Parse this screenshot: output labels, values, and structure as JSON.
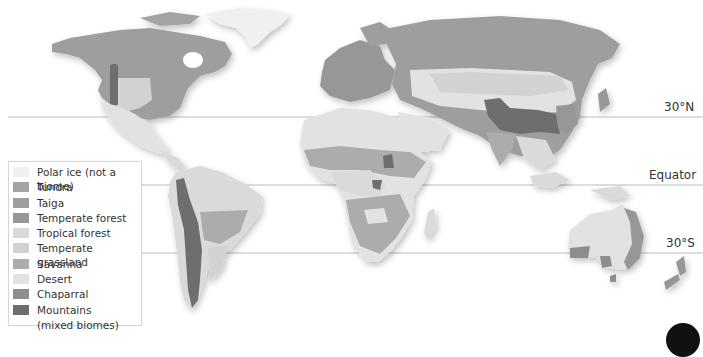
{
  "map": {
    "title": "World biomes",
    "latitude_lines": [
      {
        "label": "30°N",
        "y": 117
      },
      {
        "label": "Equator",
        "y": 185
      },
      {
        "label": "30°S",
        "y": 253
      }
    ]
  },
  "legend": {
    "items": [
      {
        "label": "Polar ice (not a biome)",
        "color": "#f0f0f0"
      },
      {
        "label": "Tundra",
        "color": "#a3a3a3"
      },
      {
        "label": "Taiga",
        "color": "#9e9e9e"
      },
      {
        "label": "Temperate forest",
        "color": "#979797"
      },
      {
        "label": "Tropical forest",
        "color": "#dadada"
      },
      {
        "label": "Temperate grassland",
        "color": "#d2d2d2"
      },
      {
        "label": "Savanna",
        "color": "#acacac"
      },
      {
        "label": "Desert",
        "color": "#e2e2e2"
      },
      {
        "label": "Chaparral",
        "color": "#8e8e8e"
      },
      {
        "label": "Mountains",
        "color": "#6e6e6e"
      }
    ],
    "mountains_sub": "(mixed biomes)"
  }
}
